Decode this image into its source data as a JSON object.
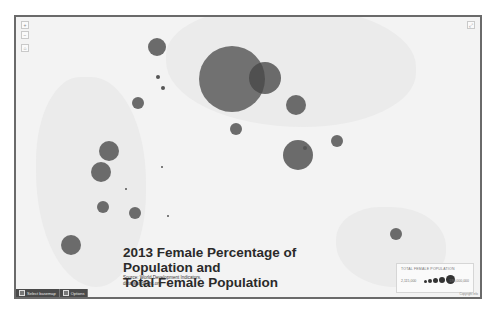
{
  "map": {
    "title_line1": "2013 Female Percentage of Population and",
    "title_line2": "Total Female Population",
    "source_line1": "Source: World Development Indicators,",
    "source_line2": "data.worldbank.org",
    "zoom_in_label": "+",
    "zoom_out_label": "−",
    "home_label": "⌂",
    "fullscreen_label": "⤢",
    "bubble_color": "#5f5f5f"
  },
  "legend": {
    "title": "TOTAL FEMALE POPULATION",
    "min_label": "2,115,000",
    "max_label": "590,000,000",
    "credit": "Copyright info"
  },
  "toolbar": {
    "basemap_label": "Select basemap",
    "options_label": "Options"
  },
  "bubbles": [
    {
      "name": "India",
      "cx": 232,
      "cy": 79,
      "r": 33
    },
    {
      "name": "China",
      "cx": 265,
      "cy": 78,
      "r": 16
    },
    {
      "name": "Indonesia",
      "cx": 298,
      "cy": 155,
      "r": 15
    },
    {
      "name": "Myanmar/Thailand",
      "cx": 296,
      "cy": 105,
      "r": 10
    },
    {
      "name": "Pakistan/Iran",
      "cx": 157,
      "cy": 47,
      "r": 9
    },
    {
      "name": "Ethiopia",
      "cx": 109,
      "cy": 151,
      "r": 10
    },
    {
      "name": "Kenya/Tanzania",
      "cx": 101,
      "cy": 172,
      "r": 10
    },
    {
      "name": "South Africa",
      "cx": 71,
      "cy": 245,
      "r": 10
    },
    {
      "name": "Mozambique",
      "cx": 103,
      "cy": 207,
      "r": 6
    },
    {
      "name": "Madagascar",
      "cx": 135,
      "cy": 213,
      "r": 6
    },
    {
      "name": "Yemen/Oman",
      "cx": 138,
      "cy": 103,
      "r": 6
    },
    {
      "name": "Sri Lanka",
      "cx": 236,
      "cy": 129,
      "r": 6
    },
    {
      "name": "Philippines",
      "cx": 337,
      "cy": 141,
      "r": 6
    },
    {
      "name": "Australia",
      "cx": 396,
      "cy": 234,
      "r": 6
    }
  ],
  "dots": [
    {
      "cx": 158,
      "cy": 77,
      "r": 2
    },
    {
      "cx": 163,
      "cy": 88,
      "r": 2
    },
    {
      "cx": 305,
      "cy": 148,
      "r": 2
    },
    {
      "cx": 162,
      "cy": 167,
      "r": 1
    },
    {
      "cx": 126,
      "cy": 189,
      "r": 1
    },
    {
      "cx": 168,
      "cy": 216,
      "r": 1
    }
  ]
}
